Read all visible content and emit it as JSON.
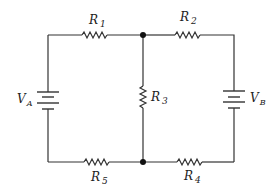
{
  "diagram": {
    "type": "circuit-schematic",
    "components": {
      "R1": {
        "letter": "R",
        "sub": "1"
      },
      "R2": {
        "letter": "R",
        "sub": "2"
      },
      "R3": {
        "letter": "R",
        "sub": "3"
      },
      "R4": {
        "letter": "R",
        "sub": "4"
      },
      "R5": {
        "letter": "R",
        "sub": "5"
      },
      "VA": {
        "letter": "V",
        "sub": "A"
      },
      "VB": {
        "letter": "V",
        "sub": "B"
      }
    },
    "colors": {
      "wire": "#333333",
      "background": "#ffffff"
    }
  }
}
